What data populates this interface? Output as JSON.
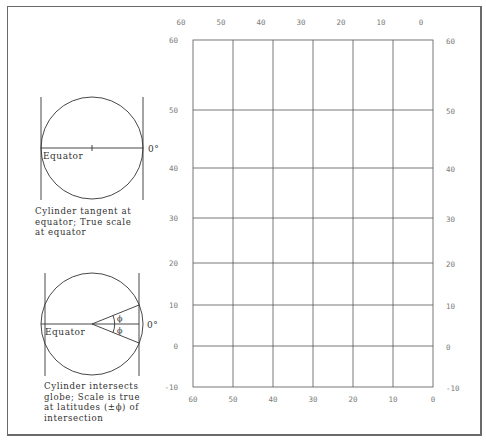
{
  "chart_data": {
    "type": "grid",
    "title": "",
    "x_ticks_top": [
      "60",
      "50",
      "40",
      "30",
      "20",
      "10",
      "0"
    ],
    "x_ticks_bottom": [
      "60",
      "50",
      "40",
      "30",
      "20",
      "10",
      "0"
    ],
    "y_ticks_left": [
      "60",
      "50",
      "40",
      "30",
      "20",
      "10",
      "0",
      "-10"
    ],
    "y_ticks_right": [
      "60",
      "50",
      "40",
      "30",
      "20",
      "10",
      "0",
      "-10"
    ],
    "y_positions_px": [
      40,
      110,
      168,
      218,
      263,
      305,
      346,
      387
    ],
    "x_positions_px": [
      193,
      233,
      273,
      313,
      353,
      393,
      433
    ],
    "xlim": [
      60,
      0
    ],
    "ylim": [
      -10,
      60
    ],
    "grid": true
  },
  "diagrams": {
    "tangent": {
      "equator_label": "Equator",
      "zero_label": "0°",
      "caption": "Cylinder tangent at\nequator; True scale\nat equator"
    },
    "secant": {
      "equator_label": "Equator",
      "zero_label": "0°",
      "phi_upper": "ϕ",
      "phi_lower": "ϕ",
      "caption": "Cylinder intersects\nglobe; Scale is true\nat latitudes (±ϕ) of\nintersection"
    }
  }
}
